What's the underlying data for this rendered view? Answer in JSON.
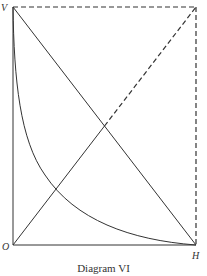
{
  "diagram": {
    "caption": "Diagram VI",
    "labels": {
      "vertical_axis": "V",
      "origin": "O",
      "horizontal_axis": "H"
    },
    "elements": [
      {
        "name": "vertical-axis",
        "from": "O",
        "to": "V",
        "style": "solid"
      },
      {
        "name": "horizontal-axis",
        "from": "O",
        "to": "H",
        "style": "solid"
      },
      {
        "name": "top-edge",
        "from": "V",
        "to": "corner",
        "style": "dashed"
      },
      {
        "name": "right-edge",
        "from": "corner",
        "to": "H",
        "style": "dashed"
      },
      {
        "name": "diagonal-v-h",
        "from": "V",
        "to": "H",
        "style": "solid"
      },
      {
        "name": "diagonal-o-corner",
        "from": "O",
        "to": "corner",
        "style": "solid then dashed above intersection with V-H line"
      },
      {
        "name": "hyperbola-curve",
        "from": "V",
        "to": "H",
        "style": "solid",
        "shape": "convex decreasing curve"
      }
    ]
  }
}
